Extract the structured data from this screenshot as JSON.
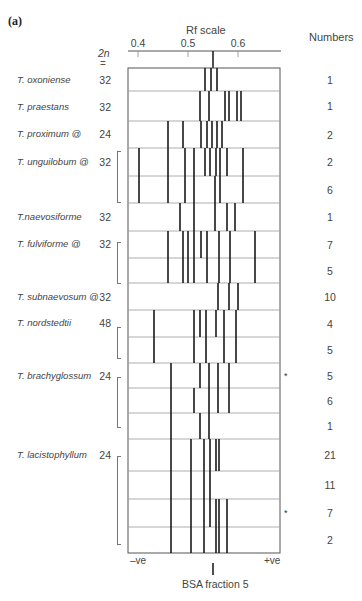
{
  "panel_label": "(a)",
  "header": {
    "axis_title": "Rf scale",
    "numbers_title": "Numbers",
    "chrom_title": "2n",
    "chrom_equals": "="
  },
  "axis": {
    "ticks": [
      {
        "label": "0.4",
        "x": 138
      },
      {
        "label": "0.5",
        "x": 188
      },
      {
        "label": "0.6",
        "x": 238
      }
    ],
    "negative_label": "–ve",
    "positive_label": "+ve",
    "reference_label": "BSA fraction 5"
  },
  "chart_data": {
    "type": "table",
    "xlabel": "Rf scale",
    "x_tick_labels": [
      "0.4",
      "0.5",
      "0.6"
    ],
    "xlim": [
      0.38,
      0.68
    ],
    "reference": {
      "label": "BSA fraction 5",
      "rf": 0.55
    },
    "polarity": {
      "left": "–ve",
      "right": "+ve"
    },
    "columns": [
      "Species",
      "2n",
      "Band Rf positions",
      "Numbers"
    ],
    "rows": [
      {
        "species": "T. oxoniense",
        "chrom": "32",
        "number": "1",
        "bands": [
          0.534,
          0.546,
          0.558
        ]
      },
      {
        "species": "T. praestans",
        "chrom": "32",
        "number": "1",
        "bands": [
          0.524,
          0.542,
          0.574,
          0.582,
          0.598,
          0.606
        ]
      },
      {
        "species": "T. proximum @",
        "chrom": "24",
        "number": "2",
        "bands": [
          0.46,
          0.49,
          0.526,
          0.538,
          0.548,
          0.558,
          0.568
        ]
      },
      {
        "species": "T. unguilobum @",
        "chrom": "32",
        "number": "2",
        "bands": [
          0.402,
          0.46,
          0.494,
          0.512,
          0.534,
          0.544,
          0.556,
          0.564,
          0.578,
          0.61
        ]
      },
      {
        "species": "",
        "chrom": "",
        "number": "6",
        "bands": [
          0.402,
          0.46,
          0.494,
          0.512,
          0.554,
          0.564,
          0.61
        ]
      },
      {
        "species": "T.naevosiforme",
        "chrom": "32",
        "number": "1",
        "bands": [
          0.484,
          0.512,
          0.554,
          0.578,
          0.594
        ]
      },
      {
        "species": "T. fulviforme @",
        "chrom": "32",
        "number": "7",
        "bands": [
          0.46,
          0.49,
          0.5,
          0.512,
          0.526,
          0.538,
          0.562,
          0.584,
          0.634
        ]
      },
      {
        "species": "",
        "chrom": "",
        "number": "5",
        "bands": [
          0.46,
          0.49,
          0.5,
          0.512,
          0.538,
          0.562,
          0.584,
          0.634
        ]
      },
      {
        "species": "T. subnaevosum @",
        "chrom": "32",
        "number": "10",
        "bands": [
          0.56,
          0.582,
          0.6
        ]
      },
      {
        "species": "T. nordstedtii",
        "chrom": "48",
        "number": "4",
        "bands": [
          0.432,
          0.512,
          0.524,
          0.536,
          0.556,
          0.572,
          0.596
        ]
      },
      {
        "species": "",
        "chrom": "",
        "number": "5",
        "bands": [
          0.432,
          0.512,
          0.536,
          0.572,
          0.596
        ]
      },
      {
        "species": "T. brachyglossum",
        "chrom": "24",
        "number": "5",
        "asterisk": true,
        "bands": [
          0.466,
          0.524,
          0.542,
          0.56,
          0.582
        ]
      },
      {
        "species": "",
        "chrom": "",
        "number": "6",
        "bands": [
          0.466,
          0.512,
          0.542,
          0.56,
          0.582
        ]
      },
      {
        "species": "",
        "chrom": "",
        "number": "1",
        "bands": [
          0.466,
          0.524,
          0.542
        ]
      },
      {
        "species": "T. lacistophyllum",
        "chrom": "24",
        "number": "21",
        "bands": [
          0.466,
          0.506,
          0.532,
          0.544,
          0.556,
          0.562
        ]
      },
      {
        "species": "",
        "chrom": "",
        "number": "11",
        "bands": [
          0.466,
          0.506,
          0.532,
          0.544
        ]
      },
      {
        "species": "",
        "chrom": "",
        "number": "7",
        "asterisk": true,
        "bands": [
          0.466,
          0.506,
          0.532,
          0.544,
          0.556,
          0.562,
          0.578
        ]
      },
      {
        "species": "",
        "chrom": "",
        "number": "2",
        "bands": [
          0.466,
          0.506,
          0.532,
          0.556,
          0.562,
          0.578
        ]
      }
    ]
  },
  "species_labels": [
    {
      "name": "T. oxoniense",
      "chrom": "32",
      "y": 80
    },
    {
      "name": "T. praestans",
      "chrom": "32",
      "y": 107
    },
    {
      "name": "T. proximum @",
      "chrom": "24",
      "y": 134
    },
    {
      "name": "T. unguilobum @",
      "chrom": "32",
      "y": 162
    },
    {
      "name": "T.naevosiforme",
      "chrom": "32",
      "y": 217
    },
    {
      "name": "T. fulviforme @",
      "chrom": "32",
      "y": 244
    },
    {
      "name": "T. subnaevosum @",
      "chrom": "32",
      "y": 297
    },
    {
      "name": "T. nordstedtii",
      "chrom": "48",
      "y": 323
    },
    {
      "name": "T. brachyglossum",
      "chrom": "24",
      "y": 376
    },
    {
      "name": "T. lacistophyllum",
      "chrom": "24",
      "y": 455
    }
  ],
  "brackets": [
    {
      "top": 151,
      "height": 50
    },
    {
      "top": 242,
      "height": 40
    },
    {
      "top": 327,
      "height": 30
    },
    {
      "top": 377,
      "height": 49
    },
    {
      "top": 456,
      "height": 87
    }
  ]
}
